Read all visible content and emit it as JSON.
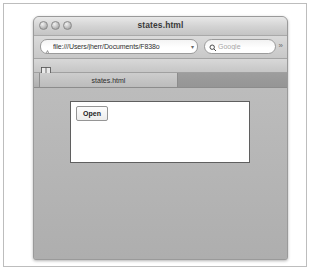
{
  "window": {
    "title": "states.html",
    "traffic_lights": [
      "close",
      "minimize",
      "zoom"
    ]
  },
  "toolbar": {
    "url_value": "file:///Users/jherr/Documents/F838o",
    "url_placeholder": "Enter address",
    "url_dropdown_icon": "▾",
    "favicon_name": "page-favicon",
    "search_icon": "search-icon",
    "search_placeholder": "Google",
    "search_dropdown_icon": "▾",
    "overflow_icon": "»"
  },
  "bookmarks_bar": {
    "book_icon": "bookmarks-book-icon"
  },
  "tabs": [
    {
      "label": "states.html",
      "active": true
    },
    {
      "label": "",
      "active": false
    }
  ],
  "content": {
    "open_button_label": "Open",
    "panel_body_text": ""
  },
  "colors": {
    "window_chrome": "#c8c8c8",
    "page_background": "#b7b7b7",
    "panel_background": "#ffffff",
    "panel_border": "#5f5f5f",
    "text": "#2d2d2d"
  }
}
